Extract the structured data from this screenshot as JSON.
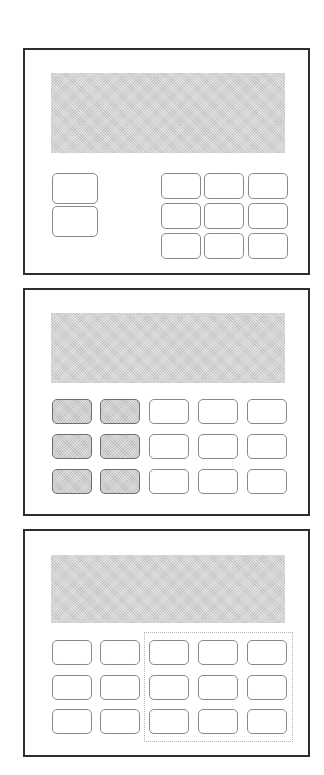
{
  "figure": {
    "colors": {
      "frame_border": "#2e2e2e",
      "display_fill": "#d3d3d3",
      "key_border": "#8a8a8a",
      "key_shaded_fill": "#cfcfcf",
      "highlight_border": "#b5b5b5"
    }
  },
  "devices": [
    {
      "id": "device-1",
      "frame": {
        "x": 23,
        "y": 48,
        "w": 287,
        "h": 227
      },
      "display": {
        "x": 51,
        "y": 73,
        "w": 234,
        "h": 80
      },
      "keys": [
        {
          "x": 52,
          "y": 173,
          "w": 46,
          "h": 31,
          "shaded": false,
          "group": "left-column"
        },
        {
          "x": 52,
          "y": 206,
          "w": 46,
          "h": 31,
          "shaded": false,
          "group": "left-column"
        },
        {
          "x": 161,
          "y": 173,
          "w": 40,
          "h": 26,
          "shaded": false,
          "group": "keypad"
        },
        {
          "x": 204,
          "y": 173,
          "w": 40,
          "h": 26,
          "shaded": false,
          "group": "keypad"
        },
        {
          "x": 248,
          "y": 173,
          "w": 40,
          "h": 26,
          "shaded": false,
          "group": "keypad"
        },
        {
          "x": 161,
          "y": 203,
          "w": 40,
          "h": 26,
          "shaded": false,
          "group": "keypad"
        },
        {
          "x": 204,
          "y": 203,
          "w": 40,
          "h": 26,
          "shaded": false,
          "group": "keypad"
        },
        {
          "x": 248,
          "y": 203,
          "w": 40,
          "h": 26,
          "shaded": false,
          "group": "keypad"
        },
        {
          "x": 161,
          "y": 233,
          "w": 40,
          "h": 26,
          "shaded": false,
          "group": "keypad"
        },
        {
          "x": 204,
          "y": 233,
          "w": 40,
          "h": 26,
          "shaded": false,
          "group": "keypad"
        },
        {
          "x": 248,
          "y": 233,
          "w": 40,
          "h": 26,
          "shaded": false,
          "group": "keypad"
        }
      ]
    },
    {
      "id": "device-2",
      "frame": {
        "x": 23,
        "y": 288,
        "w": 287,
        "h": 228
      },
      "display": {
        "x": 51,
        "y": 313,
        "w": 234,
        "h": 70
      },
      "keys": [
        {
          "x": 52,
          "y": 399,
          "w": 40,
          "h": 25,
          "shaded": true
        },
        {
          "x": 100,
          "y": 399,
          "w": 40,
          "h": 25,
          "shaded": true
        },
        {
          "x": 149,
          "y": 399,
          "w": 40,
          "h": 25,
          "shaded": false
        },
        {
          "x": 198,
          "y": 399,
          "w": 40,
          "h": 25,
          "shaded": false
        },
        {
          "x": 247,
          "y": 399,
          "w": 40,
          "h": 25,
          "shaded": false
        },
        {
          "x": 52,
          "y": 434,
          "w": 40,
          "h": 25,
          "shaded": true
        },
        {
          "x": 100,
          "y": 434,
          "w": 40,
          "h": 25,
          "shaded": true
        },
        {
          "x": 149,
          "y": 434,
          "w": 40,
          "h": 25,
          "shaded": false
        },
        {
          "x": 198,
          "y": 434,
          "w": 40,
          "h": 25,
          "shaded": false
        },
        {
          "x": 247,
          "y": 434,
          "w": 40,
          "h": 25,
          "shaded": false
        },
        {
          "x": 52,
          "y": 469,
          "w": 40,
          "h": 25,
          "shaded": true
        },
        {
          "x": 100,
          "y": 469,
          "w": 40,
          "h": 25,
          "shaded": true
        },
        {
          "x": 149,
          "y": 469,
          "w": 40,
          "h": 25,
          "shaded": false
        },
        {
          "x": 198,
          "y": 469,
          "w": 40,
          "h": 25,
          "shaded": false
        },
        {
          "x": 247,
          "y": 469,
          "w": 40,
          "h": 25,
          "shaded": false
        }
      ]
    },
    {
      "id": "device-3",
      "frame": {
        "x": 23,
        "y": 529,
        "w": 287,
        "h": 228
      },
      "display": {
        "x": 51,
        "y": 555,
        "w": 234,
        "h": 68
      },
      "highlight": {
        "x": 144,
        "y": 632,
        "w": 149,
        "h": 110
      },
      "keys": [
        {
          "x": 52,
          "y": 640,
          "w": 40,
          "h": 25,
          "shaded": false
        },
        {
          "x": 100,
          "y": 640,
          "w": 40,
          "h": 25,
          "shaded": false
        },
        {
          "x": 149,
          "y": 640,
          "w": 40,
          "h": 25,
          "shaded": false
        },
        {
          "x": 198,
          "y": 640,
          "w": 40,
          "h": 25,
          "shaded": false
        },
        {
          "x": 247,
          "y": 640,
          "w": 40,
          "h": 25,
          "shaded": false
        },
        {
          "x": 52,
          "y": 675,
          "w": 40,
          "h": 25,
          "shaded": false
        },
        {
          "x": 100,
          "y": 675,
          "w": 40,
          "h": 25,
          "shaded": false
        },
        {
          "x": 149,
          "y": 675,
          "w": 40,
          "h": 25,
          "shaded": false
        },
        {
          "x": 198,
          "y": 675,
          "w": 40,
          "h": 25,
          "shaded": false
        },
        {
          "x": 247,
          "y": 675,
          "w": 40,
          "h": 25,
          "shaded": false
        },
        {
          "x": 52,
          "y": 709,
          "w": 40,
          "h": 25,
          "shaded": false
        },
        {
          "x": 100,
          "y": 709,
          "w": 40,
          "h": 25,
          "shaded": false
        },
        {
          "x": 149,
          "y": 709,
          "w": 40,
          "h": 25,
          "shaded": false
        },
        {
          "x": 198,
          "y": 709,
          "w": 40,
          "h": 25,
          "shaded": false
        },
        {
          "x": 247,
          "y": 709,
          "w": 40,
          "h": 25,
          "shaded": false
        }
      ]
    }
  ]
}
